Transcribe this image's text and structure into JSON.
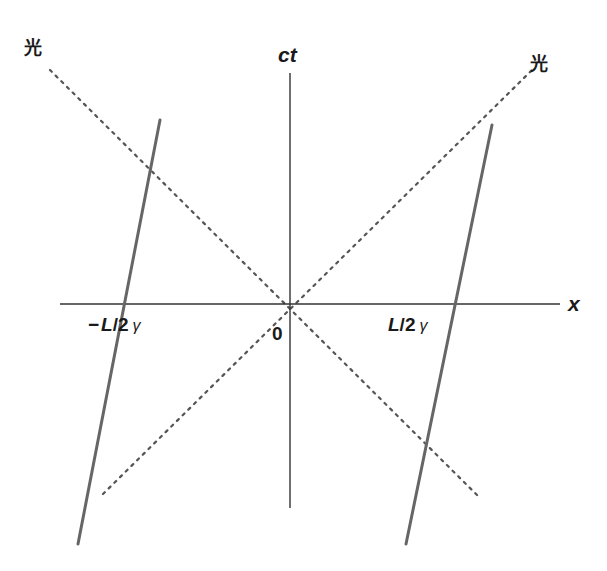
{
  "diagram": {
    "type": "spacetime-diagram",
    "axes": {
      "vertical_label": "ct",
      "horizontal_label": "x",
      "origin_label": "0"
    },
    "light_lines": {
      "upper_left_label": "光",
      "upper_right_label": "光",
      "style": "dotted"
    },
    "worldlines": [
      {
        "name": "left-end",
        "tick_label_prefix": "−",
        "tick_label": "L",
        "tick_label_mid": "/2",
        "tick_label_suffix": "γ"
      },
      {
        "name": "right-end",
        "tick_label_prefix": "",
        "tick_label": "L",
        "tick_label_mid": "/2",
        "tick_label_suffix": "γ"
      }
    ],
    "colors": {
      "axis": "#333333",
      "worldline": "#666666",
      "light": "#555555",
      "text": "#1a1a1a"
    }
  }
}
